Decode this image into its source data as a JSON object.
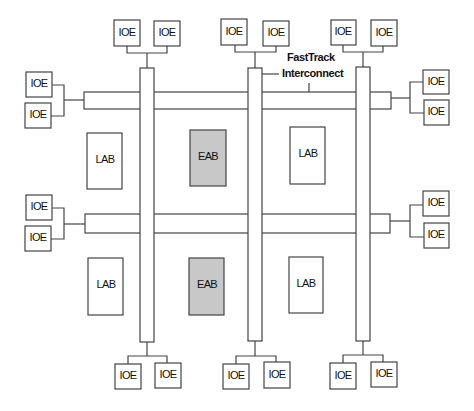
{
  "diagram": {
    "interconnect_label_line1": "FastTrack",
    "interconnect_label_line2": "Interconnect",
    "block_labels": {
      "ioe": "IOE",
      "lab": "LAB",
      "eab": "EAB"
    },
    "colors": {
      "line": "#444444",
      "eab_fill": "#c8c8c8",
      "background": "#ffffff"
    },
    "ioe_top": [
      "IOE",
      "IOE",
      "IOE",
      "IOE",
      "IOE",
      "IOE"
    ],
    "ioe_bottom": [
      "IOE",
      "IOE",
      "IOE",
      "IOE",
      "IOE",
      "IOE"
    ],
    "ioe_left": [
      "IOE",
      "IOE",
      "IOE",
      "IOE"
    ],
    "ioe_right": [
      "IOE",
      "IOE",
      "IOE",
      "IOE"
    ],
    "labs": [
      "LAB",
      "LAB",
      "LAB",
      "LAB"
    ],
    "eabs": [
      "EAB",
      "EAB"
    ]
  }
}
